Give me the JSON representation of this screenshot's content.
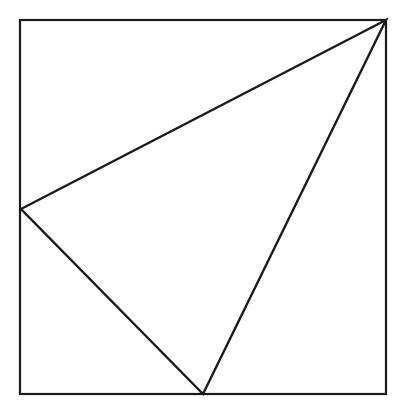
{
  "figure": {
    "canvas": {
      "width": 406,
      "height": 412,
      "background": "#ffffff"
    },
    "stroke_color": "#1a1a1a",
    "fill_color": "none",
    "square": {
      "label": "Bounding square",
      "x": 20,
      "y": 20,
      "width": 366,
      "height": 374,
      "stroke_width": 2.2,
      "corners": {
        "top_left": [
          20,
          20
        ],
        "top_right": [
          386,
          20
        ],
        "bottom_right": [
          386,
          394
        ],
        "bottom_left": [
          20,
          394
        ]
      }
    },
    "triangle": {
      "label": "Inscribed triangle",
      "stroke_width": 2.4,
      "vertices": [
        {
          "name": "apex-top-right",
          "x": 386,
          "y": 20,
          "on_edge": "top-right-corner"
        },
        {
          "name": "vertex-left",
          "x": 21,
          "y": 209,
          "on_edge": "left-side"
        },
        {
          "name": "vertex-bottom",
          "x": 203,
          "y": 394,
          "on_edge": "bottom-side"
        }
      ],
      "edges": [
        {
          "name": "edge-apex-to-left",
          "from": "apex-top-right",
          "to": "vertex-left"
        },
        {
          "name": "edge-left-to-bottom",
          "from": "vertex-left",
          "to": "vertex-bottom"
        },
        {
          "name": "edge-bottom-to-apex",
          "from": "vertex-bottom",
          "to": "apex-top-right"
        }
      ]
    }
  }
}
